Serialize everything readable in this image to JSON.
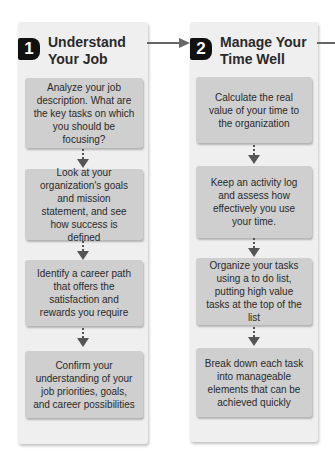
{
  "colors": {
    "panel_bg": "#efefef",
    "box_bg": "#cfcfcf",
    "badge_bg": "#111111",
    "arrow": "#666666",
    "text": "#2a2a2a"
  },
  "steps": [
    {
      "number": "1",
      "title_line1": "Understand",
      "title_line2": "Your Job",
      "boxes": [
        "Analyze your job description. What are the key tasks on which you should be focusing?",
        "Look at your organization's goals and mission statement, and see how success is defined",
        "Identify a career path that offers the satisfaction and rewards you require",
        "Confirm your understanding of your job priorities, goals, and career possibilities"
      ]
    },
    {
      "number": "2",
      "title_line1": "Manage Your",
      "title_line2": "Time Well",
      "boxes": [
        "Calculate the real value of your time to the organization",
        "Keep an activity log and assess how effectively you use your time.",
        "Organize your tasks using a to do list, putting high value tasks at the top of the list",
        "Break down each task into manageable elements that can be achieved quickly"
      ]
    }
  ],
  "icons": {
    "down_arrow": "dotted-down-arrow-icon",
    "right_arrow": "right-arrow-icon"
  }
}
